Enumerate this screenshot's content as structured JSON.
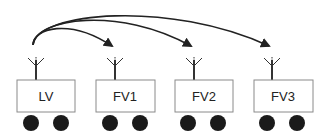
{
  "diagram": {
    "type": "platoon-communication",
    "colors": {
      "stroke": "#333333",
      "box_fill": "#ffffff",
      "box_stroke": "#8a8a8a",
      "wheel": "#1a1a1a",
      "arrow": "#222222"
    },
    "vehicles": [
      {
        "id": "lv",
        "label": "LV",
        "role": "leader"
      },
      {
        "id": "fv1",
        "label": "FV1",
        "role": "follower"
      },
      {
        "id": "fv2",
        "label": "FV2",
        "role": "follower"
      },
      {
        "id": "fv3",
        "label": "FV3",
        "role": "follower"
      }
    ],
    "links": [
      {
        "from": "LV",
        "to": "FV1"
      },
      {
        "from": "LV",
        "to": "FV2"
      },
      {
        "from": "LV",
        "to": "FV3"
      }
    ]
  }
}
